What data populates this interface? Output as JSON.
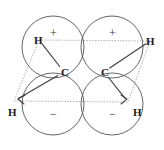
{
  "figure": {
    "kind": "orbital-diagram",
    "molecule": "ethene-pi-bond",
    "width": 164,
    "height": 150,
    "background_color": "#ffffff",
    "stroke_color": "#555555",
    "dotted_color": "#8a8a8a",
    "bond_color": "#444444",
    "text_color": "#1a1a1a"
  },
  "lobes": [
    {
      "id": "top-left",
      "sign": "+",
      "cx": 53,
      "cy": 47,
      "r": 31,
      "sign_x": 53,
      "sign_y": 33
    },
    {
      "id": "top-right",
      "sign": "+",
      "cx": 112,
      "cy": 47,
      "r": 31,
      "sign_x": 112,
      "sign_y": 33
    },
    {
      "id": "bottom-left",
      "sign": "−",
      "cx": 53,
      "cy": 104,
      "r": 31,
      "sign_x": 53,
      "sign_y": 114
    },
    {
      "id": "bottom-right",
      "sign": "−",
      "cx": 112,
      "cy": 104,
      "r": 31,
      "sign_x": 112,
      "sign_y": 114
    }
  ],
  "atoms": [
    {
      "id": "carbon-left",
      "element": "C",
      "x": 64,
      "y": 72,
      "label_left": 61,
      "label_top": 67
    },
    {
      "id": "carbon-right",
      "element": "C",
      "x": 104,
      "y": 72,
      "label_left": 101,
      "label_top": 67
    },
    {
      "id": "hydrogen-upper-left",
      "element": "H",
      "x": 39,
      "y": 40,
      "label_left": 34,
      "label_top": 35
    },
    {
      "id": "hydrogen-upper-right",
      "element": "H",
      "x": 150,
      "y": 41,
      "label_left": 146,
      "label_top": 36
    },
    {
      "id": "hydrogen-lower-left",
      "element": "H",
      "x": 14,
      "y": 101,
      "label_left": 8,
      "label_top": 107
    },
    {
      "id": "hydrogen-lower-right",
      "element": "H",
      "x": 128,
      "y": 102,
      "label_left": 133,
      "label_top": 107
    }
  ],
  "bonds": [
    {
      "id": "bond-CL-HUL",
      "from": "carbon-left",
      "to": "hydrogen-upper-left",
      "style": "solid"
    },
    {
      "id": "bond-CL-HLL",
      "from": "carbon-left",
      "to": "hydrogen-lower-left",
      "style": "solid"
    },
    {
      "id": "bond-CR-HUR",
      "from": "carbon-right",
      "to": "hydrogen-upper-right",
      "style": "solid"
    },
    {
      "id": "bond-CR-HLR",
      "from": "carbon-right",
      "to": "hydrogen-lower-right",
      "style": "solid"
    }
  ],
  "plane": {
    "id": "molecular-plane",
    "style": "dotted",
    "vertices": [
      {
        "x": 39,
        "y": 40
      },
      {
        "x": 150,
        "y": 41
      },
      {
        "x": 128,
        "y": 102
      },
      {
        "x": 14,
        "y": 101
      }
    ]
  },
  "captions": {
    "title": "",
    "note": ""
  }
}
